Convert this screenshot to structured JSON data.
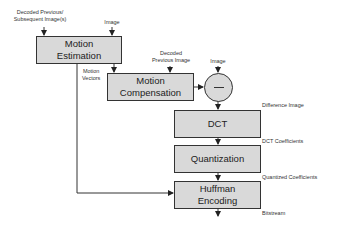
{
  "diagram": {
    "boxes": {
      "motion_estimation": "Motion\nEstimation",
      "motion_compensation": "Motion\nCompensation",
      "dct": "DCT",
      "quantization": "Quantization",
      "huffman": "Huffman\nEncoding"
    },
    "subtract_symbol": "minus",
    "labels": {
      "decoded_prev_subsequent": "Decoded Previous/\nSubsequent Image(s)",
      "image_top": "Image",
      "motion_vectors": "Motion\nVectors",
      "decoded_previous_image": "Decoded\nPrevious Image",
      "image_circle": "Image",
      "difference_image": "Difference Image",
      "dct_coefficients": "DCT Coefficients",
      "quantized_coefficients": "Quantized Coefficients",
      "bitstream": "Bitstream"
    },
    "colors": {
      "box_fill": "#d9d9d9",
      "stroke": "#333333"
    }
  }
}
